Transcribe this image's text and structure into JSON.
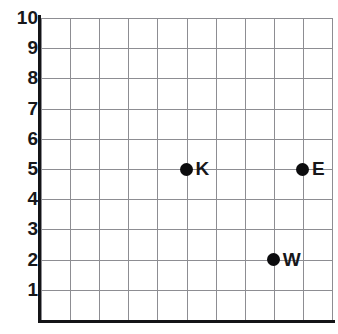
{
  "chart_data": {
    "type": "scatter",
    "title": "",
    "xlabel": "",
    "ylabel": "",
    "xlim": [
      0,
      10
    ],
    "ylim": [
      0,
      10
    ],
    "grid": true,
    "legend": "none",
    "x_tick_labels": [],
    "y_tick_labels": [
      "10",
      "9",
      "8",
      "7",
      "6",
      "5",
      "4",
      "3",
      "2",
      "1"
    ],
    "points": [
      {
        "label": "K",
        "x": 5,
        "y": 5
      },
      {
        "label": "E",
        "x": 9,
        "y": 5
      },
      {
        "label": "W",
        "x": 8,
        "y": 2
      }
    ]
  },
  "style": {
    "grid_color": "#8d8d92",
    "axis_color": "#141417",
    "point_color": "#0c0c0e",
    "text_color": "#17171a",
    "background": "#ffffff"
  }
}
